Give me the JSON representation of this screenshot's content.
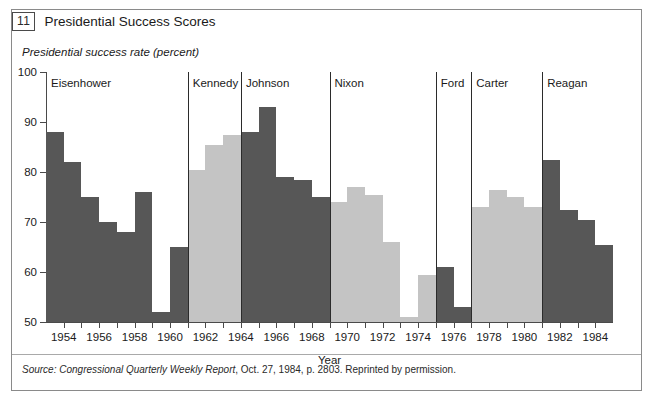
{
  "figure": {
    "number": "11",
    "title": "Presidential Success Scores"
  },
  "source_note": {
    "prefix": "Source:",
    "publication": "Congressional Quarterly Weekly Report",
    "rest": ", Oct. 27, 1984, p. 2803. Reprinted by permission."
  },
  "colors": {
    "dark_bar": "#575757",
    "light_bar": "#c4c4c4",
    "axis": "#4a4a4a",
    "divider": "#2b2b2b",
    "frame": "#8a8a8a"
  },
  "chart_data": {
    "type": "bar",
    "title": "Presidential Success Scores",
    "ylabel": "Presidential success rate (percent)",
    "xlabel": "Year",
    "ylim": [
      50,
      100
    ],
    "ytick_labels": [
      "50",
      "60",
      "70",
      "80",
      "90",
      "100"
    ],
    "ytick_values": [
      50,
      60,
      70,
      80,
      90,
      100
    ],
    "xlim": [
      1953,
      1985
    ],
    "xtick_labels": [
      "1954",
      "1956",
      "1958",
      "1960",
      "1962",
      "1964",
      "1966",
      "1968",
      "1970",
      "1972",
      "1974",
      "1976",
      "1978",
      "1980",
      "1982",
      "1984"
    ],
    "xtick_values": [
      1954,
      1956,
      1958,
      1960,
      1962,
      1964,
      1966,
      1968,
      1970,
      1972,
      1974,
      1976,
      1978,
      1980,
      1982,
      1984
    ],
    "grid": false,
    "legend": "none",
    "categories": [
      1953,
      1954,
      1955,
      1956,
      1957,
      1958,
      1959,
      1960,
      1961,
      1962,
      1963,
      1964,
      1965,
      1966,
      1967,
      1968,
      1969,
      1970,
      1971,
      1972,
      1973,
      1974,
      1975,
      1976,
      1977,
      1978,
      1979,
      1980,
      1981,
      1982,
      1983,
      1984
    ],
    "values": [
      88,
      82,
      75,
      70,
      68,
      76,
      52,
      65,
      80.5,
      85.5,
      87.5,
      88,
      93,
      79,
      78.5,
      75,
      74,
      77,
      75.5,
      66,
      51,
      59.5,
      61,
      53,
      73,
      76.5,
      75,
      73,
      82.5,
      72.5,
      70.5,
      65.5
    ],
    "bars": [
      {
        "year": 1953,
        "value": 88,
        "president": "Eisenhower",
        "shade": "dark"
      },
      {
        "year": 1954,
        "value": 82,
        "president": "Eisenhower",
        "shade": "dark"
      },
      {
        "year": 1955,
        "value": 75,
        "president": "Eisenhower",
        "shade": "dark"
      },
      {
        "year": 1956,
        "value": 70,
        "president": "Eisenhower",
        "shade": "dark"
      },
      {
        "year": 1957,
        "value": 68,
        "president": "Eisenhower",
        "shade": "dark"
      },
      {
        "year": 1958,
        "value": 76,
        "president": "Eisenhower",
        "shade": "dark"
      },
      {
        "year": 1959,
        "value": 52,
        "president": "Eisenhower",
        "shade": "dark"
      },
      {
        "year": 1960,
        "value": 65,
        "president": "Eisenhower",
        "shade": "dark"
      },
      {
        "year": 1961,
        "value": 80.5,
        "president": "Kennedy",
        "shade": "light"
      },
      {
        "year": 1962,
        "value": 85.5,
        "president": "Kennedy",
        "shade": "light"
      },
      {
        "year": 1963,
        "value": 87.5,
        "president": "Kennedy",
        "shade": "light"
      },
      {
        "year": 1964,
        "value": 88,
        "president": "Johnson",
        "shade": "dark"
      },
      {
        "year": 1965,
        "value": 93,
        "president": "Johnson",
        "shade": "dark"
      },
      {
        "year": 1966,
        "value": 79,
        "president": "Johnson",
        "shade": "dark"
      },
      {
        "year": 1967,
        "value": 78.5,
        "president": "Johnson",
        "shade": "dark"
      },
      {
        "year": 1968,
        "value": 75,
        "president": "Johnson",
        "shade": "dark"
      },
      {
        "year": 1969,
        "value": 74,
        "president": "Nixon",
        "shade": "light"
      },
      {
        "year": 1970,
        "value": 77,
        "president": "Nixon",
        "shade": "light"
      },
      {
        "year": 1971,
        "value": 75.5,
        "president": "Nixon",
        "shade": "light"
      },
      {
        "year": 1972,
        "value": 66,
        "president": "Nixon",
        "shade": "light"
      },
      {
        "year": 1973,
        "value": 51,
        "president": "Nixon",
        "shade": "light"
      },
      {
        "year": 1974,
        "value": 59.5,
        "president": "Nixon",
        "shade": "light"
      },
      {
        "year": 1975,
        "value": 61,
        "president": "Ford",
        "shade": "dark"
      },
      {
        "year": 1976,
        "value": 53,
        "president": "Ford",
        "shade": "dark"
      },
      {
        "year": 1977,
        "value": 73,
        "president": "Carter",
        "shade": "light"
      },
      {
        "year": 1978,
        "value": 76.5,
        "president": "Carter",
        "shade": "light"
      },
      {
        "year": 1979,
        "value": 75,
        "president": "Carter",
        "shade": "light"
      },
      {
        "year": 1980,
        "value": 73,
        "president": "Carter",
        "shade": "light"
      },
      {
        "year": 1981,
        "value": 82.5,
        "president": "Reagan",
        "shade": "dark"
      },
      {
        "year": 1982,
        "value": 72.5,
        "president": "Reagan",
        "shade": "dark"
      },
      {
        "year": 1983,
        "value": 70.5,
        "president": "Reagan",
        "shade": "dark"
      },
      {
        "year": 1984,
        "value": 65.5,
        "president": "Reagan",
        "shade": "dark"
      }
    ],
    "administrations": [
      {
        "name": "Eisenhower",
        "start_year": 1953,
        "end_year": 1961,
        "shade": "dark"
      },
      {
        "name": "Kennedy",
        "start_year": 1961,
        "end_year": 1964,
        "shade": "light"
      },
      {
        "name": "Johnson",
        "start_year": 1964,
        "end_year": 1969,
        "shade": "dark"
      },
      {
        "name": "Nixon",
        "start_year": 1969,
        "end_year": 1975,
        "shade": "light"
      },
      {
        "name": "Ford",
        "start_year": 1975,
        "end_year": 1977,
        "shade": "dark"
      },
      {
        "name": "Carter",
        "start_year": 1977,
        "end_year": 1981,
        "shade": "light"
      },
      {
        "name": "Reagan",
        "start_year": 1981,
        "end_year": 1985,
        "shade": "dark"
      }
    ]
  }
}
